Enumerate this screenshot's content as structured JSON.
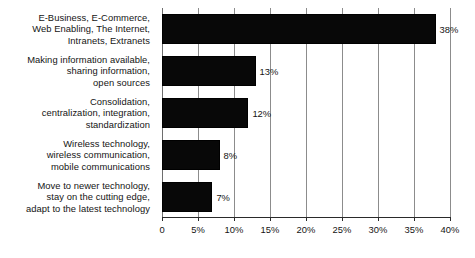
{
  "chart_data": {
    "type": "bar",
    "orientation": "horizontal",
    "title": "",
    "subtitle": "",
    "xlabel": "",
    "ylabel": "",
    "xlim": [
      0,
      40
    ],
    "grid": true,
    "legend": false,
    "legend_position": "none",
    "xticks": [
      0,
      5,
      10,
      15,
      20,
      25,
      30,
      35,
      40
    ],
    "xtick_labels": [
      "0",
      "5%",
      "10%",
      "15%",
      "20%",
      "25%",
      "30%",
      "35%",
      "40%"
    ],
    "bar_color": "#080808",
    "categories": [
      "E-Business, E-Commerce,\nWeb Enabling, The Internet,\nIntranets, Extranets",
      "Making information available,\nsharing information,\nopen sources",
      "Consolidation,\ncentralization, integration,\nstandardization",
      "Wireless technology,\nwireless communication,\nmobile communications",
      "Move to newer technology,\nstay on the cutting edge,\nadapt to the latest technology"
    ],
    "values": [
      38,
      13,
      12,
      8,
      7
    ],
    "data_labels": [
      "38%",
      "13%",
      "12%",
      "8%",
      "7%"
    ],
    "bars": [
      {
        "label_lines": [
          "E-Business, E-Commerce,",
          "Web Enabling, The Internet,",
          "Intranets, Extranets"
        ],
        "value": 38,
        "data_label": "38%"
      },
      {
        "label_lines": [
          "Making information available,",
          "sharing information,",
          "open sources"
        ],
        "value": 13,
        "data_label": "13%"
      },
      {
        "label_lines": [
          "Consolidation,",
          "centralization, integration,",
          "standardization"
        ],
        "value": 12,
        "data_label": "12%"
      },
      {
        "label_lines": [
          "Wireless technology,",
          "wireless communication,",
          "mobile communications"
        ],
        "value": 8,
        "data_label": "8%"
      },
      {
        "label_lines": [
          "Move to newer technology,",
          "stay on the cutting edge,",
          "adapt to the latest technology"
        ],
        "value": 7,
        "data_label": "7%"
      }
    ]
  }
}
